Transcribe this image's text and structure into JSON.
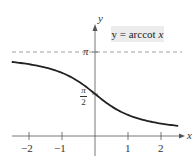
{
  "chart_data": {
    "type": "line",
    "title": "",
    "function": "y = arccot x",
    "legend_label": "y = arccot x",
    "legend_prefix": "y = arccot",
    "legend_var": "x",
    "xlabel": "x",
    "ylabel": "y",
    "xlim": [
      -2.5,
      2.6
    ],
    "ylim": [
      -0.7,
      4.1
    ],
    "x_ticks": [
      -2,
      -1,
      1,
      2
    ],
    "x_tick_labels": [
      "−2",
      "−1",
      "1",
      "2"
    ],
    "y_ticks": [
      1.5708,
      3.1416
    ],
    "y_tick_labels": [
      "π/2",
      "π"
    ],
    "pi_label": "π",
    "half_pi_num": "π",
    "half_pi_den": "2",
    "asymptote": {
      "y": 3.1416,
      "style": "dashed"
    },
    "grid": false,
    "series": [
      {
        "name": "arccot x",
        "x": [
          -2.5,
          -2,
          -1.5,
          -1,
          -0.5,
          0,
          0.5,
          1,
          1.5,
          2,
          2.5
        ],
        "values": [
          2.7611,
          2.6779,
          2.5536,
          2.3562,
          2.0344,
          1.5708,
          1.1071,
          0.7854,
          0.588,
          0.4636,
          0.3805
        ]
      }
    ]
  }
}
